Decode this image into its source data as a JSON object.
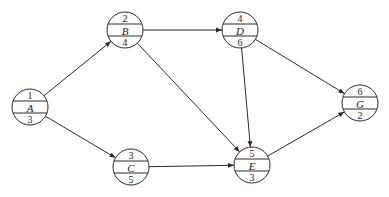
{
  "diagram": {
    "type": "activity-on-node network",
    "nodes": [
      {
        "id": "A",
        "top": "1",
        "name": "A",
        "bottom": "3",
        "cx": 30,
        "cy": 107
      },
      {
        "id": "B",
        "top": "2",
        "name": "B",
        "bottom": "4",
        "cx": 125,
        "cy": 30
      },
      {
        "id": "C",
        "top": "3",
        "name": "C",
        "bottom": "5",
        "cx": 131,
        "cy": 167
      },
      {
        "id": "D",
        "top": "4",
        "name": "D",
        "bottom": "6",
        "cx": 240,
        "cy": 30
      },
      {
        "id": "E",
        "top": "5",
        "name": "E",
        "bottom": "3",
        "cx": 252,
        "cy": 165
      },
      {
        "id": "G",
        "top": "6",
        "name": "G",
        "bottom": "2",
        "cx": 360,
        "cy": 103
      }
    ],
    "edges": [
      {
        "from": "A",
        "to": "B"
      },
      {
        "from": "A",
        "to": "C"
      },
      {
        "from": "B",
        "to": "D"
      },
      {
        "from": "B",
        "to": "E"
      },
      {
        "from": "C",
        "to": "E"
      },
      {
        "from": "D",
        "to": "E"
      },
      {
        "from": "D",
        "to": "G"
      },
      {
        "from": "E",
        "to": "G"
      }
    ],
    "colors": {
      "stroke": "#2a2a2a",
      "text": "#222222",
      "background": "#ffffff"
    }
  }
}
